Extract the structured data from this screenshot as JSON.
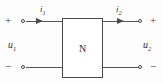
{
  "diagram": {
    "network": {
      "block_label": "N"
    },
    "ports": {
      "input": {
        "current_label": "i",
        "current_subscript": "1",
        "voltage_label": "u",
        "voltage_subscript": "1",
        "top_polarity": "+",
        "bottom_polarity": "−"
      },
      "output": {
        "current_label": "i",
        "current_subscript": "2",
        "voltage_label": "u",
        "voltage_subscript": "2",
        "top_polarity": "+",
        "bottom_polarity": "−"
      }
    },
    "colors": {
      "line": "#555555",
      "text": "#2f2f2f",
      "background": "#fdfdfd",
      "box_fill": "#ffffff"
    },
    "icons": {
      "input_current_arrow": "arrow-right-icon",
      "output_current_arrow": "arrow-right-icon",
      "terminal": "open-circle-terminal-icon"
    }
  }
}
